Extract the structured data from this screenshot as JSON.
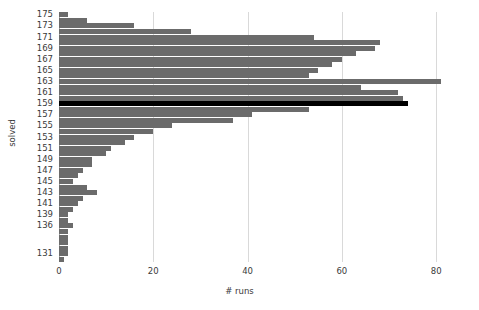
{
  "chart_data": {
    "type": "bar",
    "orientation": "horizontal",
    "title": "",
    "xlabel": "# runs",
    "ylabel": "solved",
    "xlim": [
      0,
      84
    ],
    "xticks": [
      0,
      20,
      40,
      60,
      80
    ],
    "xtick_labels": [
      "0",
      "20",
      "40",
      "60",
      "80"
    ],
    "grid": "vertical-only",
    "legend": "none",
    "bar_color": "#6b6b6b",
    "highlight_color": "#000000",
    "highlight_category": "159",
    "categories": [
      "175",
      "174",
      "173",
      "172",
      "171",
      "170",
      "169",
      "168",
      "167",
      "166",
      "165",
      "164",
      "163",
      "162",
      "161",
      "160",
      "159",
      "158",
      "157",
      "156",
      "155",
      "154",
      "153",
      "152",
      "151",
      "150",
      "149",
      "148",
      "147",
      "146",
      "145",
      "144",
      "143",
      "142",
      "141",
      "140",
      "139",
      "138",
      "136",
      "135",
      "134",
      "133",
      "132",
      "131",
      "130"
    ],
    "ytick_labels": [
      "175",
      "173",
      "171",
      "169",
      "167",
      "165",
      "163",
      "161",
      "159",
      "157",
      "155",
      "153",
      "151",
      "149",
      "147",
      "145",
      "143",
      "141",
      "139",
      "136",
      "131"
    ],
    "values": [
      2,
      6,
      16,
      28,
      54,
      68,
      67,
      63,
      60,
      58,
      55,
      53,
      81,
      64,
      72,
      73,
      74,
      53,
      41,
      37,
      24,
      20,
      16,
      14,
      11,
      10,
      7,
      7,
      5,
      4,
      3,
      6,
      8,
      5,
      4,
      3,
      2,
      2,
      3,
      2,
      2,
      2,
      2,
      2,
      1
    ]
  }
}
